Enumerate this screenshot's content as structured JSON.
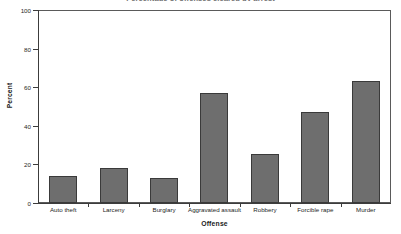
{
  "chart_data": {
    "type": "bar",
    "title": "Percentage of offenses cleared by arrest",
    "xlabel": "Offense",
    "ylabel": "Percent",
    "categories": [
      "Auto theft",
      "Larceny",
      "Burglary",
      "Aggravated assault",
      "Robbery",
      "Forcible rape",
      "Murder"
    ],
    "values": [
      14,
      18,
      13,
      57,
      25.5,
      47,
      63
    ],
    "ylim": [
      0,
      100
    ],
    "yticks": [
      0,
      20,
      40,
      60,
      80,
      100
    ],
    "ytick_labels": [
      "0",
      "20",
      "40",
      "60",
      "80",
      "100"
    ],
    "grid": false,
    "legend": null,
    "bar_color": "#6e6e6e",
    "bar_edge_color": "#3a3a3a",
    "axis_color": "#3c3c3c",
    "frame_color": "#5a5a5a",
    "background": "#ffffff"
  }
}
